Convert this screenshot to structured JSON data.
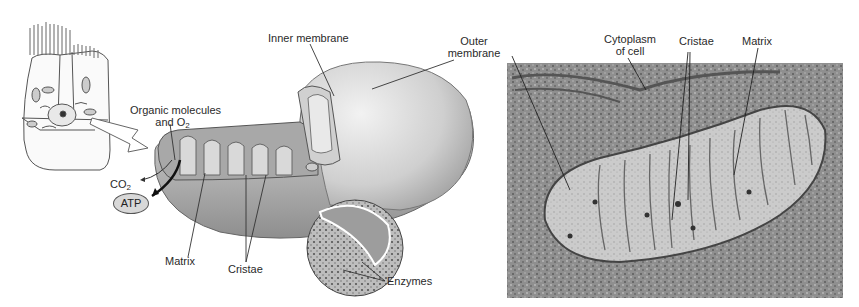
{
  "figure": {
    "panels": [
      {
        "id": "cell",
        "description": "Epithelial cell with microvilli showing mitochondria location"
      },
      {
        "id": "cutaway",
        "description": "Cutaway drawing of mitochondrion"
      },
      {
        "id": "micrograph",
        "description": "Electron micrograph of mitochondrion"
      }
    ]
  },
  "labels": {
    "organic_molecules": "Organic molecules",
    "and_o2_prefix": "and O",
    "o2_sub": "2",
    "co2_prefix": "CO",
    "co2_sub": "2",
    "atp": "ATP",
    "inner_membrane": "Inner membrane",
    "outer_membrane_line1": "Outer",
    "outer_membrane_line2": "membrane",
    "matrix_left": "Matrix",
    "cristae_left": "Cristae",
    "enzymes": "Enzymes",
    "cytoplasm_line1": "Cytoplasm",
    "cytoplasm_line2": "of cell",
    "cristae_right": "Cristae",
    "matrix_right": "Matrix"
  },
  "colors": {
    "background": "#ffffff",
    "membrane_fill": "#c9c9c9",
    "membrane_dark": "#8a8a8a",
    "micrograph_base": "#9a9a9a",
    "label_text": "#2a2a2a"
  }
}
